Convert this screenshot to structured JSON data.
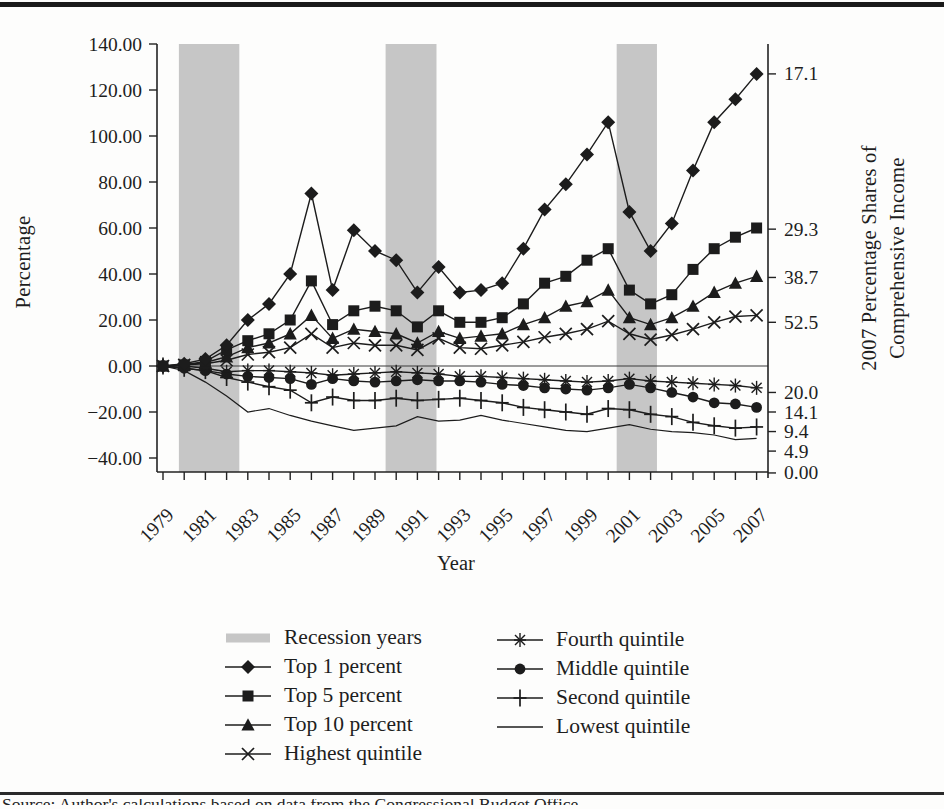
{
  "figure": {
    "left_axis_title": "Percentage",
    "x_axis_title": "Year",
    "right_axis_title_line1": "2007 Percentage Shares of",
    "right_axis_title_line2": "Comprehensive Income",
    "caption_fragment": "Source: Author's calculations based on data from the Congressional Budget Office."
  },
  "chart_data": {
    "type": "line",
    "x": [
      1979,
      1980,
      1981,
      1982,
      1983,
      1984,
      1985,
      1986,
      1987,
      1988,
      1989,
      1990,
      1991,
      1992,
      1993,
      1994,
      1995,
      1996,
      1997,
      1998,
      1999,
      2000,
      2001,
      2002,
      2003,
      2004,
      2005,
      2006,
      2007
    ],
    "x_tick_labels": [
      "1979",
      "1981",
      "1983",
      "1985",
      "1987",
      "1989",
      "1991",
      "1993",
      "1995",
      "1997",
      "1999",
      "2001",
      "2003",
      "2005",
      "2007"
    ],
    "xlabel": "Year",
    "ylabel_left": "Percentage",
    "ylabel_right": "2007 Percentage Shares of Comprehensive Income",
    "ylim": [
      -40,
      140
    ],
    "left_axis_ticks": [
      {
        "label": "140.00",
        "value": 140
      },
      {
        "label": "120.00",
        "value": 120
      },
      {
        "label": "100.00",
        "value": 100
      },
      {
        "label": "80.00",
        "value": 80
      },
      {
        "label": "60.00",
        "value": 60
      },
      {
        "label": "40.00",
        "value": 40
      },
      {
        "label": "20.00",
        "value": 20
      },
      {
        "label": "0.00",
        "value": 0
      },
      {
        "label": "−20.00",
        "value": -20
      },
      {
        "label": "−40.00",
        "value": -40
      }
    ],
    "right_axis_labels": [
      {
        "text": "17.1",
        "at": 127
      },
      {
        "text": "29.3",
        "at": 59.5
      },
      {
        "text": "38.7",
        "at": 38.5
      },
      {
        "text": "52.5",
        "at": 19
      },
      {
        "text": "20.0",
        "at": -11.5
      },
      {
        "text": "14.1",
        "at": -20
      },
      {
        "text": "9.4",
        "at": -28.5
      },
      {
        "text": "4.9",
        "at": -37
      },
      {
        "text": "0.00",
        "at": -46.5
      }
    ],
    "recession_bands_years": [
      [
        1979.75,
        1982.6
      ],
      [
        1989.5,
        1991.9
      ],
      [
        2000.4,
        2002.3
      ]
    ],
    "series": [
      {
        "name": "Top 1 percent",
        "marker": "diamond",
        "values": [
          0,
          1,
          3,
          9,
          20,
          27,
          40,
          75,
          33,
          59,
          50,
          46,
          32,
          43,
          32,
          33,
          36,
          51,
          68,
          79,
          92,
          106,
          67,
          50,
          62,
          85,
          106,
          116,
          127
        ]
      },
      {
        "name": "Top 5 percent",
        "marker": "square",
        "values": [
          0,
          0.5,
          2,
          7,
          11,
          14,
          20,
          37,
          18,
          24,
          26,
          24,
          17,
          24,
          19,
          19,
          21,
          27,
          36,
          39,
          46,
          51,
          33,
          27,
          31,
          42,
          51,
          56,
          60
        ]
      },
      {
        "name": "Top 10 percent",
        "marker": "triangle",
        "values": [
          0,
          0.5,
          1.5,
          4,
          8,
          10,
          14,
          22,
          12,
          16,
          15,
          14,
          10,
          15,
          12,
          13,
          14,
          18,
          21,
          26,
          28,
          33,
          21,
          18,
          21,
          26,
          32,
          36,
          39
        ]
      },
      {
        "name": "Highest quintile",
        "marker": "x",
        "values": [
          0,
          0.5,
          1,
          2.5,
          5,
          6,
          8,
          14,
          8,
          10,
          9,
          9,
          7,
          12,
          8,
          7.5,
          9,
          10.5,
          12.5,
          14,
          16,
          19.5,
          14,
          11.5,
          13.5,
          16,
          19,
          21.5,
          22
        ]
      },
      {
        "name": "Fourth quintile",
        "marker": "asterisk",
        "values": [
          0,
          0,
          -1,
          -2.5,
          -2,
          -2,
          -2.5,
          -3,
          -4,
          -3.5,
          -3,
          -2.5,
          -3,
          -3.5,
          -4.5,
          -4.5,
          -5,
          -5.5,
          -6,
          -6.5,
          -7,
          -6.5,
          -5.5,
          -6.5,
          -7,
          -7.5,
          -8,
          -8.5,
          -9.5
        ]
      },
      {
        "name": "Middle quintile",
        "marker": "circle",
        "values": [
          0,
          -1,
          -2,
          -3.5,
          -4.5,
          -5,
          -5.5,
          -8,
          -5.5,
          -6.5,
          -7,
          -6.5,
          -6,
          -6.5,
          -6.5,
          -7,
          -8,
          -8.5,
          -9.5,
          -10,
          -10.5,
          -9.5,
          -8,
          -9.5,
          -11.5,
          -13.5,
          -16,
          -16.5,
          -18
        ]
      },
      {
        "name": "Second quintile",
        "marker": "plus",
        "values": [
          0,
          -1,
          -2,
          -5,
          -7,
          -9,
          -10.5,
          -16,
          -13.5,
          -15,
          -15,
          -14,
          -15,
          -14.5,
          -14,
          -15,
          -16,
          -18,
          -19,
          -20,
          -21,
          -18.5,
          -19,
          -21,
          -22,
          -24.5,
          -26,
          -27,
          -26.5
        ]
      },
      {
        "name": "Lowest quintile",
        "marker": "none",
        "values": [
          0,
          -2,
          -7,
          -13,
          -20,
          -18.5,
          -21.5,
          -24,
          -26,
          -28,
          -27,
          -26,
          -22,
          -24,
          -23.5,
          -21.5,
          -23.5,
          -25,
          -26.5,
          -28,
          -28.5,
          -27,
          -25.5,
          -27.5,
          -28.5,
          -29,
          -30,
          -32,
          -31.5
        ]
      }
    ],
    "legend": {
      "column1": [
        {
          "label": "Recession years",
          "marker": "band"
        },
        {
          "label": "Top 1 percent",
          "marker": "diamond"
        },
        {
          "label": "Top 5 percent",
          "marker": "square"
        },
        {
          "label": "Top 10 percent",
          "marker": "triangle"
        },
        {
          "label": "Highest quintile",
          "marker": "x"
        }
      ],
      "column2": [
        {
          "label": "Fourth quintile",
          "marker": "asterisk"
        },
        {
          "label": "Middle quintile",
          "marker": "circle"
        },
        {
          "label": "Second quintile",
          "marker": "plus"
        },
        {
          "label": "Lowest quintile",
          "marker": "none"
        }
      ]
    },
    "colors": {
      "ink": "#1c1c1c",
      "band": "#c6c6c6",
      "axis": "#222222"
    },
    "grid": false,
    "legend_position": "bottom"
  }
}
